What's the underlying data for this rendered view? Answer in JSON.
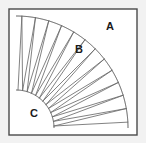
{
  "figure": {
    "canvas": {
      "width": 146,
      "height": 143
    },
    "background_color": "#f2f2f2",
    "frame": {
      "x": 9,
      "y": 9,
      "width": 128,
      "height": 126,
      "fill_color": "#ffffff",
      "stroke_color": "#4a4a4a"
    },
    "geometry": {
      "center_x": 16,
      "center_y": 128,
      "inner_radius": 38,
      "outer_radius": 112,
      "start_angle_deg": 0,
      "end_angle_deg": 90,
      "line_color": "#6b6b6b",
      "arc_color": "#555555"
    },
    "labels": [
      {
        "text": "A",
        "x": 110,
        "y": 27,
        "region": "outside-annulus-corner"
      },
      {
        "text": "B",
        "x": 79,
        "y": 50,
        "region": "annulus-wedge"
      },
      {
        "text": "C",
        "x": 34,
        "y": 114,
        "region": "inner-quarter-disc"
      }
    ],
    "divider_angles_deg": [
      3,
      10,
      17,
      24,
      31,
      38,
      45,
      52,
      59,
      66,
      73,
      80,
      87
    ],
    "chord_pairs": [
      {
        "a1": 3,
        "a2": 10
      },
      {
        "a1": 10,
        "a2": 17
      },
      {
        "a1": 17,
        "a2": 24
      },
      {
        "a1": 24,
        "a2": 31
      },
      {
        "a1": 31,
        "a2": 38
      },
      {
        "a1": 38,
        "a2": 45
      },
      {
        "a1": 45,
        "a2": 52
      },
      {
        "a1": 52,
        "a2": 59
      },
      {
        "a1": 59,
        "a2": 66
      },
      {
        "a1": 66,
        "a2": 73
      },
      {
        "a1": 73,
        "a2": 80
      },
      {
        "a1": 80,
        "a2": 87
      }
    ]
  }
}
